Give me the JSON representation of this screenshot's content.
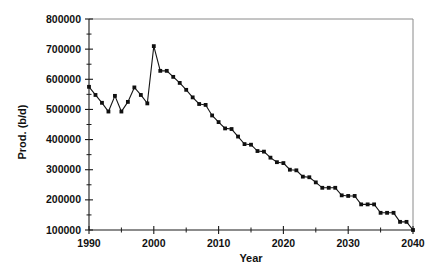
{
  "chart_data": {
    "type": "line",
    "title": "",
    "subtitle": "",
    "xlabel": "Year",
    "ylabel": "Prod. (b/d)",
    "xlim": [
      1990,
      2040
    ],
    "ylim": [
      100000,
      800000
    ],
    "x_major_ticks": [
      1990,
      2000,
      2010,
      2020,
      2030,
      2040
    ],
    "x_minor_ticks": [
      1995,
      2005,
      2015,
      2025,
      2035
    ],
    "x_tick_labels": [
      "1990",
      "2000",
      "2010",
      "2020",
      "2030",
      "2040"
    ],
    "y_major_ticks": [
      100000,
      200000,
      300000,
      400000,
      500000,
      600000,
      700000,
      800000
    ],
    "y_minor_ticks": [
      150000,
      250000,
      350000,
      450000,
      550000,
      650000,
      750000
    ],
    "y_tick_labels": [
      "100000",
      "200000",
      "300000",
      "400000",
      "500000",
      "600000",
      "700000",
      "800000"
    ],
    "grid": false,
    "legend": null,
    "legend_position": "none",
    "marker": "square",
    "line_color": "#151515",
    "marker_color": "#101010",
    "series": [
      {
        "name": "Production",
        "x": [
          1990,
          1991,
          1992,
          1993,
          1994,
          1995,
          1996,
          1997,
          1998,
          1999,
          2000,
          2001,
          2002,
          2003,
          2004,
          2005,
          2006,
          2007,
          2008,
          2009,
          2010,
          2011,
          2012,
          2013,
          2014,
          2015,
          2016,
          2017,
          2018,
          2019,
          2020,
          2021,
          2022,
          2023,
          2024,
          2025,
          2026,
          2027,
          2028,
          2029,
          2030,
          2031,
          2032,
          2033,
          2034,
          2035,
          2036,
          2037,
          2038,
          2039,
          2040
        ],
        "values": [
          575000,
          548000,
          522000,
          493000,
          545000,
          493000,
          525000,
          573000,
          548000,
          520000,
          710000,
          628000,
          628000,
          608000,
          588000,
          565000,
          540000,
          518000,
          515000,
          480000,
          458000,
          437000,
          435000,
          410000,
          385000,
          383000,
          362000,
          360000,
          340000,
          325000,
          322000,
          300000,
          298000,
          277000,
          275000,
          258000,
          240000,
          240000,
          240000,
          215000,
          213000,
          213000,
          185000,
          185000,
          185000,
          157000,
          157000,
          157000,
          127000,
          127000,
          100000
        ]
      }
    ]
  },
  "figure": {
    "background_color": "#ffffff",
    "foreground_color": "#111111"
  }
}
